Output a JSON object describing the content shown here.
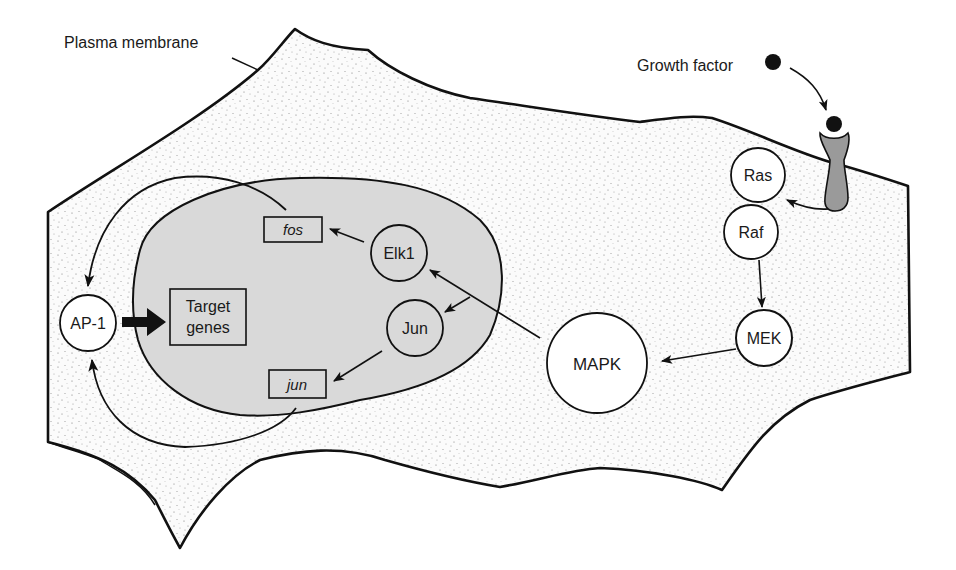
{
  "diagram": {
    "labels": {
      "plasma_membrane": "Plasma membrane",
      "growth_factor": "Growth factor"
    },
    "nodes": {
      "ras": "Ras",
      "raf": "Raf",
      "mek": "MEK",
      "mapk": "MAPK",
      "elk1": "Elk1",
      "jun_protein": "Jun",
      "fos_gene": "fos",
      "jun_gene": "jun",
      "ap1": "AP-1",
      "target_genes_line1": "Target",
      "target_genes_line2": "genes"
    },
    "edges": [
      {
        "from": "Growth factor",
        "to": "Receptor"
      },
      {
        "from": "Receptor",
        "to": "Ras"
      },
      {
        "from": "Raf",
        "to": "MEK"
      },
      {
        "from": "MEK",
        "to": "MAPK"
      },
      {
        "from": "MAPK",
        "to": "Elk1"
      },
      {
        "from": "MAPK",
        "to": "Jun"
      },
      {
        "from": "Elk1",
        "to": "fos"
      },
      {
        "from": "Jun",
        "to": "jun"
      },
      {
        "from": "fos",
        "to": "AP-1"
      },
      {
        "from": "jun",
        "to": "AP-1"
      },
      {
        "from": "AP-1",
        "to": "Target genes"
      }
    ],
    "colors": {
      "outline": "#111111",
      "nucleus_fill": "#d9d9d9",
      "receptor_fill": "#9a9a9a",
      "cytoplasm_fill": "#fbfbfb",
      "stipple": "#6a6a6a"
    }
  }
}
